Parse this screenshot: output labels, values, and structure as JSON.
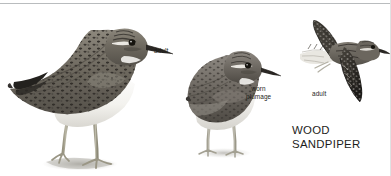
{
  "plate": {
    "species_name": "WOOD\nSANDPIPER",
    "background_color": "#ffffff",
    "text_color": "#1d1d1b",
    "rule_color": "#b9bcbe"
  },
  "labels": {
    "standing_adult": "adult",
    "worn_plumage": "worn\nplumage",
    "flight_adult": "adult"
  },
  "figures": [
    {
      "name": "standing-adult",
      "label": "adult",
      "pose": "standing, side profile facing right",
      "plumage_colors": {
        "upperparts": "#6f6a60",
        "spots": "#2b2824",
        "underparts": "#f7f6f3",
        "legs": "#a9a592",
        "bill": "#2a2724",
        "shadow": "#b8b6b0"
      }
    },
    {
      "name": "worn-plumage",
      "label": "worn plumage",
      "pose": "standing, three-quarter front view facing right",
      "plumage_colors": {
        "upperparts": "#75706a",
        "spots": "#33302c",
        "underparts": "#efeee9",
        "legs": "#b3b0a4",
        "bill": "#2a2724",
        "shadow": "#cac8c3"
      }
    },
    {
      "name": "flight-adult",
      "label": "adult",
      "pose": "in flight, wings spread, facing right",
      "plumage_colors": {
        "upperwing": "#3a3731",
        "body": "#6d6860",
        "underwing_pale": "#e8e6e0",
        "tail_bars": "#3a3731",
        "bill": "#2a2724"
      }
    }
  ]
}
